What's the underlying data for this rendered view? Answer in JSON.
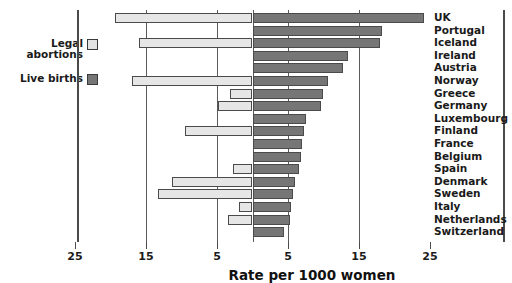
{
  "chart_data": {
    "type": "bar",
    "subtype": "butterfly-diverging-horizontal",
    "title": "",
    "xlabel": "Rate per 1000 women",
    "ylabel": "",
    "grid": true,
    "legend_position": "left",
    "axis": {
      "left_ticks": [
        25,
        15,
        5
      ],
      "right_ticks": [
        5,
        15,
        25
      ],
      "left_max": 25,
      "right_max": 25,
      "center_value": 0
    },
    "categories": [
      "UK",
      "Portugal",
      "Iceland",
      "Ireland",
      "Austria",
      "Norway",
      "Greece",
      "Germany",
      "Luxembourg",
      "Finland",
      "France",
      "Belgium",
      "Spain",
      "Denmark",
      "Sweden",
      "Italy",
      "Netherlands",
      "Switzerland"
    ],
    "series": [
      {
        "name": "Legal abortions",
        "direction": "left",
        "color": "#e6e6e6",
        "values": [
          19.4,
          0.0,
          16.0,
          0.0,
          0.0,
          17.0,
          3.1,
          4.8,
          0.0,
          9.5,
          0.0,
          0.0,
          2.7,
          11.3,
          13.3,
          1.9,
          3.4,
          0.0
        ]
      },
      {
        "name": "Live births",
        "direction": "right",
        "color": "#767676",
        "values": [
          24.2,
          18.2,
          18.0,
          13.5,
          12.7,
          10.6,
          9.9,
          9.6,
          7.5,
          7.2,
          7.0,
          6.8,
          6.6,
          6.0,
          5.7,
          5.4,
          5.3,
          4.4
        ]
      }
    ]
  },
  "legend": {
    "items": [
      {
        "label": "Legal\nabortions",
        "swatch": "light-swatch"
      },
      {
        "label": "Live births",
        "swatch": "dark-swatch"
      }
    ]
  },
  "axis_labels": {
    "left": [
      "25",
      "15",
      "5"
    ],
    "right": [
      "5",
      "15",
      "25"
    ],
    "title": "Rate per 1000 women"
  },
  "colors": {
    "light_bar": "#e6e6e6",
    "dark_bar": "#767676",
    "outline": "#4a4a4a",
    "text": "#1a1a1a",
    "background": "#ffffff"
  }
}
